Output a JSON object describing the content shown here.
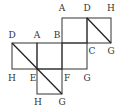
{
  "diagram": {
    "type": "cube-net",
    "vertices": {
      "top_row": [
        "A",
        "D",
        "H"
      ],
      "top_row_bottom": [
        "B",
        "C",
        "G"
      ],
      "middle_row_top": [
        "D",
        "A",
        "B"
      ],
      "middle_row_bottom": [
        "H",
        "E",
        "F",
        "G"
      ],
      "bottom_row": [
        "H",
        "G"
      ]
    },
    "diagonals": [
      {
        "from": "D",
        "to": "G",
        "face": "top-right"
      },
      {
        "from": "D",
        "to": "G",
        "face": "left-and-bottom",
        "through": "E"
      }
    ]
  },
  "labels": {
    "top_A": "A",
    "top_D": "D",
    "top_H": "H",
    "mid_D": "D",
    "mid_A": "A",
    "mid_B": "B",
    "mid_C": "C",
    "mid_G": "G",
    "low_H": "H",
    "low_E": "E",
    "low_F": "F",
    "low_G": "G",
    "bot_H": "H",
    "bot_G": "G"
  }
}
